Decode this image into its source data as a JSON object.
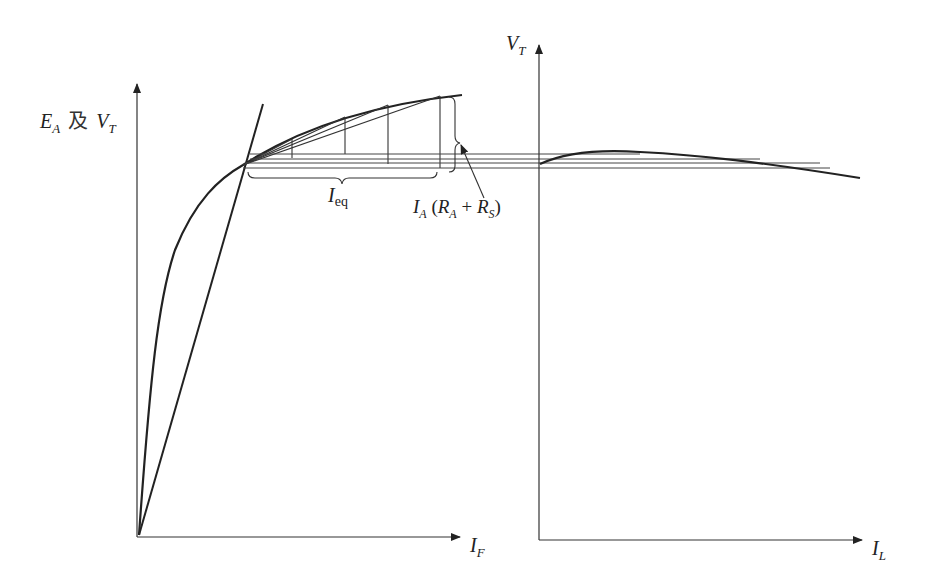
{
  "diagram": {
    "left_plot": {
      "y_axis_label": {
        "e": "E",
        "e_sub": "A",
        "conj": "及",
        "v": "V",
        "v_sub": "T"
      },
      "x_axis_label": {
        "main": "I",
        "sub": "F"
      },
      "curves": [
        "magnetization-curve",
        "field-resistance-line"
      ],
      "annotations": {
        "ieq": {
          "main": "I",
          "sub": "eq"
        },
        "drop": {
          "i": "I",
          "i_sub": "A",
          "open": " (",
          "ra": "R",
          "ra_sub": "A",
          "plus": " + ",
          "rs": "R",
          "rs_sub": "S",
          "close": ")"
        }
      }
    },
    "right_plot": {
      "y_axis_label": {
        "main": "V",
        "sub": "T"
      },
      "x_axis_label": {
        "main": "I",
        "sub": "L"
      },
      "curves": [
        "terminal-characteristic"
      ]
    },
    "colors": {
      "line": "#222222",
      "thin": "#444444",
      "background": "#ffffff"
    }
  }
}
